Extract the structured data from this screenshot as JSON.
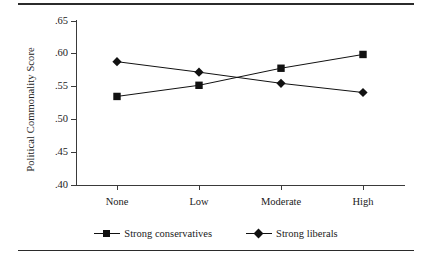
{
  "chart_data": {
    "type": "line",
    "title": "",
    "xlabel": "",
    "ylabel": "Political Commonality Score",
    "categories": [
      "None",
      "Low",
      "Moderate",
      "High"
    ],
    "ylim": [
      0.4,
      0.65
    ],
    "yticks": [
      ".40",
      ".45",
      ".50",
      ".55",
      ".60",
      ".65"
    ],
    "ytick_values": [
      0.4,
      0.45,
      0.5,
      0.55,
      0.6,
      0.65
    ],
    "grid": false,
    "legend_position": "bottom",
    "series": [
      {
        "name": "Strong conservatives",
        "marker": "square",
        "color": "#111111",
        "values": [
          0.535,
          0.552,
          0.578,
          0.599
        ]
      },
      {
        "name": "Strong liberals",
        "marker": "diamond",
        "color": "#111111",
        "values": [
          0.588,
          0.572,
          0.555,
          0.541
        ]
      }
    ]
  },
  "legend": {
    "items": [
      {
        "label": "Strong conservatives",
        "marker": "square-marker-icon"
      },
      {
        "label": "Strong liberals",
        "marker": "diamond-marker-icon"
      }
    ]
  },
  "axes": {
    "y_title": "Political Commonality Score",
    "y_labels": [
      ".65",
      ".60",
      ".55",
      ".50",
      ".45",
      ".40"
    ],
    "x_labels": [
      "None",
      "Low",
      "Moderate",
      "High"
    ]
  }
}
